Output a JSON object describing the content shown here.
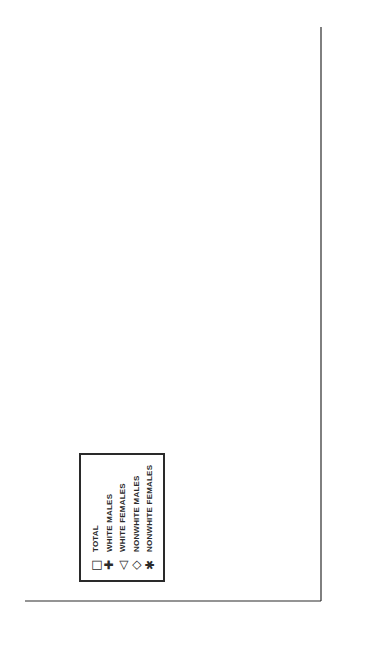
{
  "chart_data": {
    "type": "line",
    "orientation": "rotated-90 (value axis horizontal at bottom, reversed; category axis vertical on right)",
    "title": "",
    "xlabel": "AGE GROUPS (IN YEARS)",
    "ylabel": "MORTALITY RATES PER 100,000 POPULATION",
    "categories": [
      "0–1",
      "1–4",
      "5–14",
      "15–24",
      "25–34",
      "35–44",
      "45–54",
      "55–64",
      "65–74",
      "75–84"
    ],
    "ylim": [
      0,
      80
    ],
    "yticks": [
      0,
      10,
      20,
      30,
      40,
      50,
      60,
      70,
      80
    ],
    "grid": false,
    "legend_position": "inside lower-left (rotated)",
    "series": [
      {
        "name": "TOTAL",
        "marker": "square",
        "symbol": "□",
        "values": [
          6.4,
          10.3,
          9.8,
          27.4,
          20.4,
          17.6,
          20.1,
          25.5,
          34.4,
          45.3
        ]
      },
      {
        "name": "WHITE MALES",
        "marker": "plus",
        "symbol": "✚",
        "values": [
          6.4,
          13.4,
          14.8,
          50.6,
          35.8,
          29.7,
          32.7,
          41.1,
          56.0,
          80.3
        ]
      },
      {
        "name": "WHITE FEMALES",
        "marker": "triangle",
        "symbol": "◁",
        "values": [
          6.4,
          9.0,
          6.5,
          13.4,
          8.4,
          8.4,
          10.3,
          14.8,
          21.8,
          28.0
        ]
      },
      {
        "name": "NONWHITE MALES",
        "marker": "diamond",
        "symbol": "◇",
        "values": [
          6.4,
          12.3,
          12.6,
          38.3,
          45.3,
          42.5,
          44.8,
          48.7,
          56.0,
          59.9
        ]
      },
      {
        "name": "NONWHITE FEMALES",
        "marker": "asterisk",
        "symbol": "✱",
        "values": [
          6.4,
          9.5,
          6.5,
          9.5,
          10.1,
          10.1,
          11.5,
          14.0,
          16.2,
          16.2
        ]
      }
    ]
  },
  "legend": {
    "items": [
      {
        "symbol": "□",
        "label": "TOTAL"
      },
      {
        "symbol": "✚",
        "label": "WHITE MALES"
      },
      {
        "symbol": "◁",
        "label": "WHITE FEMALES"
      },
      {
        "symbol": "◇",
        "label": "NONWHITE MALES"
      },
      {
        "symbol": "✱",
        "label": "NONWHITE FEMALES"
      }
    ]
  },
  "colors": {
    "ink": "#2a2a2a",
    "background": "#ffffff"
  }
}
